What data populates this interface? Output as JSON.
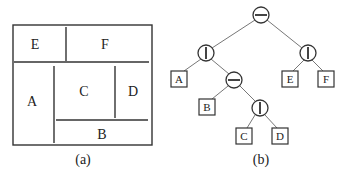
{
  "panel_a": {
    "caption": "(a)",
    "regions": {
      "E": "E",
      "F": "F",
      "A": "A",
      "C": "C",
      "D": "D",
      "B": "B"
    }
  },
  "panel_b": {
    "caption": "(b)",
    "nodes": {
      "root": {
        "type": "horizontal-cut"
      },
      "left": {
        "type": "vertical-cut"
      },
      "right": {
        "type": "vertical-cut"
      },
      "mid": {
        "type": "horizontal-cut"
      },
      "low": {
        "type": "vertical-cut"
      }
    },
    "leaves": {
      "A": "A",
      "B": "B",
      "C": "C",
      "D": "D",
      "E": "E",
      "F": "F"
    }
  }
}
